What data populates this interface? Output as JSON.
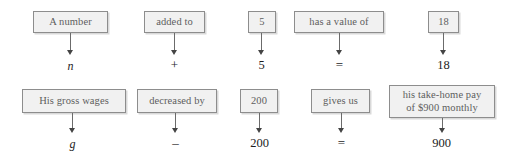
{
  "diagram": {
    "colors": {
      "box_fill": "#f1f1f1",
      "box_border": "#8d8d8d",
      "box_text": "#5e5e5e",
      "result_text": "#1d1d1d",
      "arrow": "#6b6b6b",
      "shadow": "#d9d9d9",
      "background": "#ffffff"
    },
    "rows": [
      {
        "name": "row-1",
        "cells": [
          {
            "phrase": "A number",
            "result": "n",
            "style": "var"
          },
          {
            "phrase": "added to",
            "result": "+",
            "style": "op"
          },
          {
            "phrase": "5",
            "result": "5",
            "style": "num"
          },
          {
            "phrase": "has a value of",
            "result": "=",
            "style": "op"
          },
          {
            "phrase": "18",
            "result": "18",
            "style": "num"
          }
        ]
      },
      {
        "name": "row-2",
        "cells": [
          {
            "phrase": "His gross wages",
            "result": "g",
            "style": "var"
          },
          {
            "phrase": "decreased by",
            "result": "–",
            "style": "op"
          },
          {
            "phrase": "200",
            "result": "200",
            "style": "num"
          },
          {
            "phrase": "gives us",
            "result": "=",
            "style": "op"
          },
          {
            "phrase": "his take-home pay\nof $900 monthly",
            "result": "900",
            "style": "num"
          }
        ]
      }
    ]
  }
}
